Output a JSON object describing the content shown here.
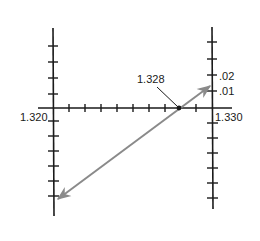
{
  "diagram": {
    "labels": {
      "left_value": "1.320",
      "right_value": "1.330",
      "intersection_value": "1.328",
      "right_scale_upper": ".02",
      "right_scale_lower": ".01"
    },
    "colors": {
      "axis": "#1a1a1a",
      "line": "#8a8a8a",
      "background": "#ffffff"
    },
    "horizontal_axis": {
      "tick_count": 9
    },
    "left_axis": {
      "ticks_above": 4,
      "ticks_below": 6
    },
    "right_axis": {
      "ticks_above": 4,
      "ticks_below": 6
    }
  }
}
